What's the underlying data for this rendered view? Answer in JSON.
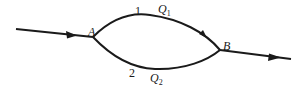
{
  "diagram": {
    "type": "parallel-pipe-flow",
    "nodes": [
      {
        "id": "A",
        "label": "A"
      },
      {
        "id": "B",
        "label": "B"
      }
    ],
    "branches": [
      {
        "number": "1",
        "flow_label": "Q",
        "flow_sub": "1",
        "position": "upper"
      },
      {
        "number": "2",
        "flow_label": "Q",
        "flow_sub": "2",
        "position": "lower"
      }
    ],
    "inflow": {
      "direction": "left-to-right",
      "into": "A"
    },
    "outflow": {
      "direction": "left-to-right",
      "from": "B"
    },
    "colors": {
      "line": "#1a1a1a",
      "background": "#ffffff"
    }
  }
}
